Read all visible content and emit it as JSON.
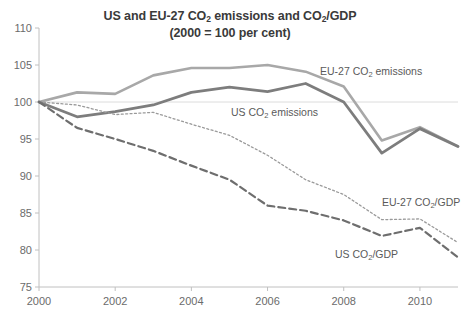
{
  "chart_data": {
    "type": "line",
    "title": "US and EU-27 CO2 emissions and CO2/GDP",
    "title_line1_pre": "US and EU-27 CO",
    "title_line1_sub": "2",
    "title_line1_mid": " emissions and CO",
    "title_line1_sub2": "2",
    "title_line1_post": "/GDP",
    "subtitle": "(2000 = 100 per cent)",
    "xlabel": "",
    "ylabel": "",
    "x": [
      2000,
      2001,
      2002,
      2003,
      2004,
      2005,
      2006,
      2007,
      2008,
      2009,
      2010,
      2011
    ],
    "xlim": [
      2000,
      2011
    ],
    "ylim": [
      75,
      110
    ],
    "yticks": [
      75,
      80,
      85,
      90,
      95,
      100,
      105,
      110
    ],
    "xticks": [
      2000,
      2002,
      2004,
      2006,
      2008,
      2010
    ],
    "xtick_labels": [
      "2000",
      "2002",
      "2004",
      "2006",
      "2008",
      "2010"
    ],
    "ytick_labels": [
      "75",
      "80",
      "85",
      "90",
      "95",
      "100",
      "105",
      "110"
    ],
    "grid": false,
    "reference_line": 100,
    "legend_position": "inline-annotations",
    "series": [
      {
        "name": "EU-27 CO2 emissions",
        "label_pre": "EU-27 CO",
        "label_sub": "2",
        "label_post": " emissions",
        "style": "solid",
        "color": "#a8a8a8",
        "width": 2.6,
        "values": [
          100.0,
          101.3,
          101.1,
          103.6,
          104.6,
          104.6,
          105.0,
          104.1,
          102.1,
          94.8,
          96.6,
          94.0
        ]
      },
      {
        "name": "US CO2 emissions",
        "label_pre": "US CO",
        "label_sub": "2",
        "label_post": " emissions",
        "style": "solid",
        "color": "#7d7d7d",
        "width": 2.8,
        "values": [
          100.0,
          98.0,
          98.7,
          99.6,
          101.3,
          102.0,
          101.4,
          102.5,
          100.0,
          93.1,
          96.4,
          94.0
        ]
      },
      {
        "name": "EU-27 CO2/GDP",
        "label_pre": "EU-27 CO",
        "label_sub": "2",
        "label_post": "/GDP",
        "style": "dotted",
        "color": "#9a9a9a",
        "width": 1.3,
        "values": [
          100.0,
          99.6,
          98.3,
          98.6,
          97.0,
          95.5,
          92.8,
          89.5,
          87.5,
          84.1,
          84.2,
          81.0
        ]
      },
      {
        "name": "US CO2/GDP",
        "label_pre": "US CO",
        "label_sub": "2",
        "label_post": "/GDP",
        "style": "dashed",
        "color": "#6e6e6e",
        "width": 2.2,
        "values": [
          100.0,
          96.5,
          95.0,
          93.4,
          91.4,
          89.5,
          86.0,
          85.3,
          84.0,
          81.9,
          83.0,
          79.0
        ]
      }
    ],
    "annotations": [
      {
        "text": "EU-27 CO2 emissions",
        "x": 320,
        "y": 65
      },
      {
        "text": "US CO2 emissions",
        "x": 231,
        "y": 106
      },
      {
        "text": "EU-27 CO2/GDP",
        "x": 382,
        "y": 196
      },
      {
        "text": "US CO2/GDP",
        "x": 335,
        "y": 248
      }
    ],
    "colors": {
      "eu_emissions": "#a8a8a8",
      "us_emissions": "#7d7d7d",
      "eu_intensity": "#9a9a9a",
      "us_intensity": "#6e6e6e",
      "axis": "#c0c0c0",
      "text": "#6b6b6b",
      "reference_line": "#dcdcdc"
    }
  }
}
